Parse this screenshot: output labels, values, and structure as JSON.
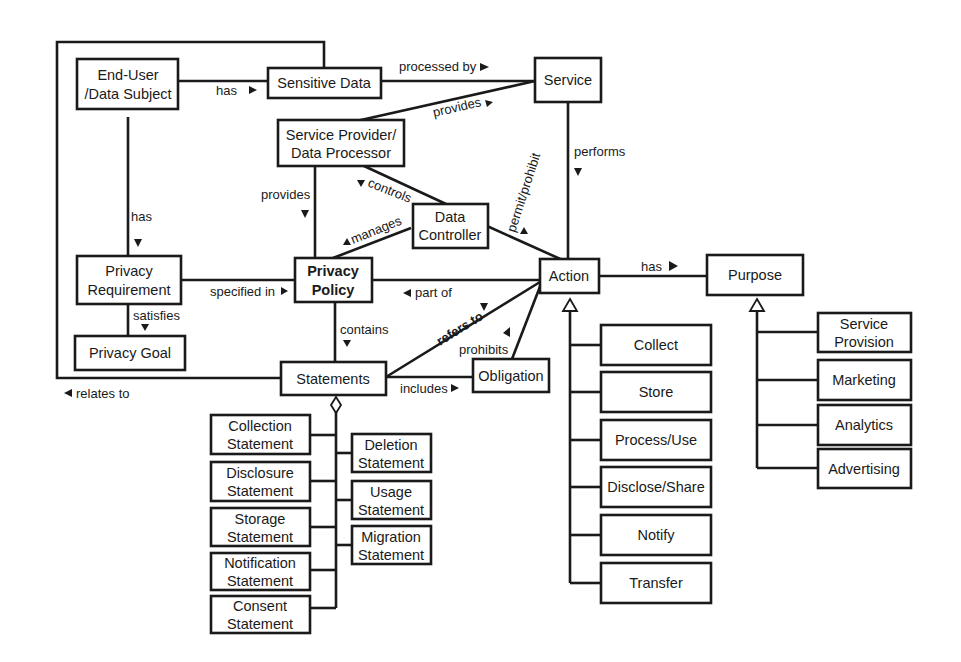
{
  "diagram": {
    "type": "UML class diagram",
    "nodes": {
      "end_user": {
        "line1": "End-User",
        "line2": "/Data Subject"
      },
      "sensitive_data": {
        "line1": "Sensitive Data"
      },
      "service": {
        "line1": "Service"
      },
      "service_provider": {
        "line1": "Service Provider/",
        "line2": "Data Processor"
      },
      "data_controller": {
        "line1": "Data",
        "line2": "Controller"
      },
      "privacy_requirement": {
        "line1": "Privacy",
        "line2": "Requirement"
      },
      "privacy_policy": {
        "line1": "Privacy",
        "line2": "Policy"
      },
      "privacy_goal": {
        "line1": "Privacy Goal"
      },
      "statements": {
        "line1": "Statements"
      },
      "obligation": {
        "line1": "Obligation"
      },
      "action": {
        "line1": "Action"
      },
      "purpose": {
        "line1": "Purpose"
      },
      "collection_statement": {
        "line1": "Collection",
        "line2": "Statement"
      },
      "disclosure_statement": {
        "line1": "Disclosure",
        "line2": "Statement"
      },
      "storage_statement": {
        "line1": "Storage",
        "line2": "Statement"
      },
      "notification_statement": {
        "line1": "Notification",
        "line2": "Statement"
      },
      "consent_statement": {
        "line1": "Consent",
        "line2": "Statement"
      },
      "deletion_statement": {
        "line1": "Deletion",
        "line2": "Statement"
      },
      "usage_statement": {
        "line1": "Usage",
        "line2": "Statement"
      },
      "migration_statement": {
        "line1": "Migration",
        "line2": "Statement"
      },
      "collect": {
        "line1": "Collect"
      },
      "store": {
        "line1": "Store"
      },
      "process_use": {
        "line1": "Process/Use"
      },
      "disclose_share": {
        "line1": "Disclose/Share"
      },
      "notify": {
        "line1": "Notify"
      },
      "transfer": {
        "line1": "Transfer"
      },
      "service_provision": {
        "line1": "Service",
        "line2": "Provision"
      },
      "marketing": {
        "line1": "Marketing"
      },
      "analytics": {
        "line1": "Analytics"
      },
      "advertising": {
        "line1": "Advertising"
      }
    },
    "edges": {
      "user_has_data": "has",
      "processed_by": "processed by",
      "provides_service": "provides",
      "performs": "performs",
      "provides_policy": "provides",
      "controls": "controls",
      "manages": "manages",
      "permit_prohibit": "permit/prohibit",
      "user_has_requirement": "has",
      "specified_in": "specified in",
      "part_of": "part of",
      "has_purpose": "has",
      "satisfies": "satisfies",
      "contains": "contains",
      "refers_to": "refers to",
      "prohibits": "prohibits",
      "includes": "includes",
      "relates_to": "relates to"
    }
  }
}
